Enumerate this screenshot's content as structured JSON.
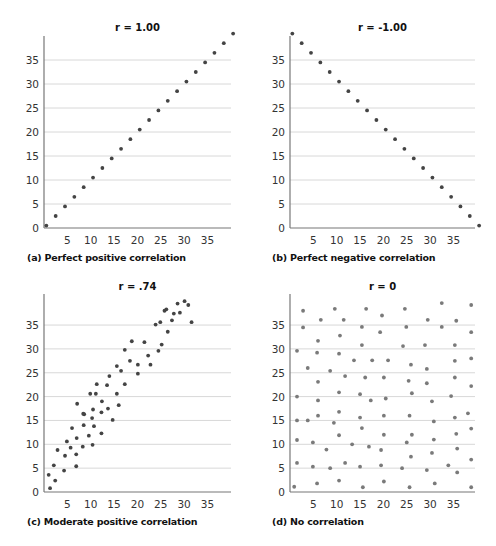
{
  "style": {
    "dot_color_dark": "#444444",
    "dot_color_light": "#7a7a7a",
    "grid_color": "#d8d8d8",
    "axis_color": "#777777"
  },
  "chart_data": [
    {
      "id": "a",
      "type": "scatter",
      "title": "r = 1.00",
      "caption": "(a) Perfect positive correlation",
      "xlabel": "",
      "ylabel": "",
      "xlim": [
        0,
        40
      ],
      "ylim": [
        0,
        40
      ],
      "xticks": [
        5,
        10,
        15,
        20,
        25,
        30,
        35
      ],
      "yticks": [
        0,
        5,
        10,
        15,
        20,
        25,
        30,
        35
      ],
      "grid": "horizontal",
      "dot_shade": "dark",
      "points": [
        [
          0.5,
          0.5
        ],
        [
          2.5,
          2.5
        ],
        [
          4.5,
          4.5
        ],
        [
          6.5,
          6.5
        ],
        [
          8.5,
          8.5
        ],
        [
          10.5,
          10.5
        ],
        [
          12.5,
          12.5
        ],
        [
          14.5,
          14.5
        ],
        [
          16.5,
          16.5
        ],
        [
          18.5,
          18.5
        ],
        [
          20.5,
          20.5
        ],
        [
          22.5,
          22.5
        ],
        [
          24.5,
          24.5
        ],
        [
          26.5,
          26.5
        ],
        [
          28.5,
          28.5
        ],
        [
          30.5,
          30.5
        ],
        [
          32.5,
          32.5
        ],
        [
          34.5,
          34.5
        ],
        [
          36.5,
          36.5
        ],
        [
          38.5,
          38.5
        ],
        [
          40.5,
          40.5
        ]
      ]
    },
    {
      "id": "b",
      "type": "scatter",
      "title": "r = -1.00",
      "caption": "(b) Perfect negative correlation",
      "xlabel": "",
      "ylabel": "",
      "xlim": [
        0,
        40
      ],
      "ylim": [
        0,
        40
      ],
      "xticks": [
        5,
        10,
        15,
        20,
        25,
        30,
        35
      ],
      "yticks": [
        0,
        5,
        10,
        15,
        20,
        25,
        30,
        35
      ],
      "grid": "horizontal",
      "dot_shade": "dark",
      "points": [
        [
          0.5,
          40.5
        ],
        [
          2.5,
          38.5
        ],
        [
          4.5,
          36.5
        ],
        [
          6.5,
          34.5
        ],
        [
          8.5,
          32.5
        ],
        [
          10.5,
          30.5
        ],
        [
          12.5,
          28.5
        ],
        [
          14.5,
          26.5
        ],
        [
          16.5,
          24.5
        ],
        [
          18.5,
          22.5
        ],
        [
          20.5,
          20.5
        ],
        [
          22.5,
          18.5
        ],
        [
          24.5,
          16.5
        ],
        [
          26.5,
          14.5
        ],
        [
          28.5,
          12.5
        ],
        [
          30.5,
          10.5
        ],
        [
          32.5,
          8.5
        ],
        [
          34.5,
          6.5
        ],
        [
          36.5,
          4.5
        ],
        [
          38.5,
          2.5
        ],
        [
          40.5,
          0.5
        ]
      ]
    },
    {
      "id": "c",
      "type": "scatter",
      "title": "r = .74",
      "caption": "(c) Moderate positive correlation",
      "xlabel": "",
      "ylabel": "",
      "xlim": [
        0,
        40
      ],
      "ylim": [
        0,
        40
      ],
      "xticks": [
        5,
        10,
        15,
        20,
        25,
        30,
        35
      ],
      "yticks": [
        0,
        5,
        10,
        15,
        20,
        25,
        30,
        35
      ],
      "grid": "horizontal",
      "dot_shade": "dark",
      "points": [
        [
          1.3,
          0.8
        ],
        [
          1.0,
          3.6
        ],
        [
          2.4,
          2.4
        ],
        [
          2.9,
          8.8
        ],
        [
          2.1,
          5.6
        ],
        [
          4.3,
          4.5
        ],
        [
          4.5,
          7.6
        ],
        [
          4.9,
          10.6
        ],
        [
          5.7,
          9.3
        ],
        [
          6.0,
          13.4
        ],
        [
          6.9,
          5.4
        ],
        [
          6.9,
          7.9
        ],
        [
          7.0,
          11.3
        ],
        [
          8.3,
          9.5
        ],
        [
          8.5,
          14.0
        ],
        [
          8.6,
          16.3
        ],
        [
          9.6,
          11.8
        ],
        [
          10.4,
          9.9
        ],
        [
          10.7,
          13.8
        ],
        [
          10.3,
          15.5
        ],
        [
          12.3,
          12.3
        ],
        [
          12.3,
          16.7
        ],
        [
          14.7,
          15.1
        ],
        [
          8.4,
          16.4
        ],
        [
          10.5,
          17.3
        ],
        [
          12.4,
          19.0
        ],
        [
          13.7,
          17.5
        ],
        [
          11.1,
          20.6
        ],
        [
          9.9,
          20.6
        ],
        [
          13.5,
          22.4
        ],
        [
          16.0,
          18.2
        ],
        [
          7.1,
          18.5
        ],
        [
          11.3,
          22.6
        ],
        [
          14.0,
          24.3
        ],
        [
          15.6,
          20.6
        ],
        [
          17.3,
          22.6
        ],
        [
          15.6,
          26.4
        ],
        [
          16.5,
          25.4
        ],
        [
          18.4,
          27.5
        ],
        [
          17.3,
          29.8
        ],
        [
          20.1,
          26.7
        ],
        [
          20.1,
          24.8
        ],
        [
          18.8,
          31.6
        ],
        [
          22.8,
          26.7
        ],
        [
          22.3,
          28.6
        ],
        [
          21.5,
          31.4
        ],
        [
          24.5,
          29.6
        ],
        [
          25.2,
          30.9
        ],
        [
          26.5,
          33.6
        ],
        [
          23.9,
          35.1
        ],
        [
          25.8,
          38.0
        ],
        [
          24.9,
          35.6
        ],
        [
          27.4,
          36.0
        ],
        [
          26.2,
          38.3
        ],
        [
          27.8,
          37.4
        ],
        [
          29.1,
          37.6
        ],
        [
          28.6,
          39.5
        ],
        [
          30.9,
          39.2
        ],
        [
          31.6,
          35.6
        ],
        [
          30.1,
          40.0
        ]
      ]
    },
    {
      "id": "d",
      "type": "scatter",
      "title": "r = 0",
      "caption": "(d) No correlation",
      "xlabel": "",
      "ylabel": "",
      "xlim": [
        0,
        40
      ],
      "ylim": [
        0,
        40
      ],
      "xticks": [
        5,
        10,
        15,
        20,
        25,
        30,
        35
      ],
      "yticks": [
        0,
        5,
        10,
        15,
        20,
        25,
        30,
        35
      ],
      "grid": "horizontal",
      "dot_shade": "light",
      "points": [
        [
          2.8,
          38.0
        ],
        [
          9.6,
          38.4
        ],
        [
          16.3,
          38.4
        ],
        [
          24.6,
          38.4
        ],
        [
          32.5,
          39.6
        ],
        [
          38.8,
          39.2
        ],
        [
          6.6,
          36.1
        ],
        [
          11.5,
          36.1
        ],
        [
          19.7,
          37.0
        ],
        [
          29.5,
          36.1
        ],
        [
          35.6,
          35.9
        ],
        [
          2.8,
          34.5
        ],
        [
          15.4,
          34.6
        ],
        [
          24.9,
          34.6
        ],
        [
          32.5,
          34.6
        ],
        [
          38.8,
          33.5
        ],
        [
          19.3,
          33.5
        ],
        [
          6.0,
          31.7
        ],
        [
          10.7,
          32.8
        ],
        [
          15.4,
          30.8
        ],
        [
          24.2,
          30.6
        ],
        [
          28.9,
          30.8
        ],
        [
          35.3,
          30.8
        ],
        [
          1.5,
          29.6
        ],
        [
          5.8,
          29.2
        ],
        [
          10.5,
          29.0
        ],
        [
          13.7,
          27.6
        ],
        [
          17.6,
          27.6
        ],
        [
          21.0,
          27.6
        ],
        [
          25.9,
          26.7
        ],
        [
          29.3,
          25.8
        ],
        [
          35.3,
          27.5
        ],
        [
          38.8,
          28.0
        ],
        [
          3.8,
          26.0
        ],
        [
          6.0,
          23.1
        ],
        [
          8.6,
          25.4
        ],
        [
          11.8,
          24.3
        ],
        [
          16.1,
          24.0
        ],
        [
          20.1,
          24.0
        ],
        [
          25.4,
          23.3
        ],
        [
          29.3,
          22.8
        ],
        [
          35.3,
          24.0
        ],
        [
          38.8,
          22.2
        ],
        [
          1.5,
          20.0
        ],
        [
          6.0,
          19.2
        ],
        [
          10.5,
          20.9
        ],
        [
          15.0,
          20.5
        ],
        [
          17.3,
          19.2
        ],
        [
          20.5,
          19.6
        ],
        [
          26.1,
          20.7
        ],
        [
          30.4,
          19.0
        ],
        [
          34.5,
          20.1
        ],
        [
          38.1,
          16.5
        ],
        [
          6.0,
          16.0
        ],
        [
          1.5,
          15.0
        ],
        [
          10.5,
          16.8
        ],
        [
          15.0,
          15.6
        ],
        [
          20.1,
          16.0
        ],
        [
          25.6,
          16.0
        ],
        [
          30.8,
          14.8
        ],
        [
          35.3,
          15.6
        ],
        [
          3.8,
          15.0
        ],
        [
          9.4,
          14.5
        ],
        [
          15.4,
          13.4
        ],
        [
          20.1,
          12.0
        ],
        [
          26.1,
          12.0
        ],
        [
          35.6,
          12.2
        ],
        [
          38.8,
          13.3
        ],
        [
          1.5,
          10.9
        ],
        [
          4.9,
          10.4
        ],
        [
          10.5,
          11.9
        ],
        [
          13.3,
          10.0
        ],
        [
          16.9,
          9.5
        ],
        [
          19.5,
          8.8
        ],
        [
          25.0,
          10.4
        ],
        [
          30.8,
          11.0
        ],
        [
          7.8,
          8.9
        ],
        [
          35.8,
          9.1
        ],
        [
          30.4,
          8.2
        ],
        [
          25.9,
          7.4
        ],
        [
          1.5,
          6.1
        ],
        [
          4.9,
          5.3
        ],
        [
          8.6,
          5.0
        ],
        [
          11.8,
          6.1
        ],
        [
          15.0,
          5.3
        ],
        [
          19.5,
          5.6
        ],
        [
          24.0,
          5.0
        ],
        [
          29.3,
          4.6
        ],
        [
          33.9,
          5.6
        ],
        [
          35.8,
          4.1
        ],
        [
          38.8,
          6.8
        ],
        [
          0.9,
          1.1
        ],
        [
          5.8,
          1.8
        ],
        [
          10.5,
          2.4
        ],
        [
          15.6,
          1.0
        ],
        [
          20.1,
          2.2
        ],
        [
          25.6,
          1.0
        ],
        [
          31.0,
          1.8
        ],
        [
          38.8,
          1.0
        ]
      ]
    }
  ]
}
